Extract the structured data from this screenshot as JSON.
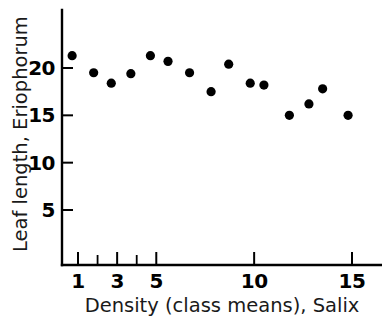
{
  "chart_data": {
    "type": "scatter",
    "title": "",
    "xlabel": "Density (class means), Salix",
    "ylabel": "Leaf length, Eriophorum",
    "xlim": [
      0.0,
      16.0
    ],
    "ylim": [
      0.0,
      23.5
    ],
    "grid": false,
    "legend": null,
    "x_ticks": [
      1,
      2,
      3,
      4,
      5,
      10,
      15
    ],
    "x_tick_labels": [
      "1",
      "",
      "3",
      "",
      "5",
      "10",
      "15"
    ],
    "y_ticks": [
      5,
      10,
      15,
      20
    ],
    "y_tick_labels": [
      "5",
      "10",
      "15",
      "20"
    ],
    "marker": "filled-circle",
    "marker_color": "#000000",
    "points": [
      {
        "x": 0.7,
        "y": 21.3
      },
      {
        "x": 1.8,
        "y": 19.5
      },
      {
        "x": 2.7,
        "y": 18.4
      },
      {
        "x": 3.7,
        "y": 19.4
      },
      {
        "x": 4.7,
        "y": 21.3
      },
      {
        "x": 5.6,
        "y": 20.7
      },
      {
        "x": 6.7,
        "y": 19.5
      },
      {
        "x": 7.8,
        "y": 17.5
      },
      {
        "x": 8.7,
        "y": 20.4
      },
      {
        "x": 9.8,
        "y": 18.4
      },
      {
        "x": 10.5,
        "y": 18.2
      },
      {
        "x": 11.8,
        "y": 15.0
      },
      {
        "x": 12.8,
        "y": 16.2
      },
      {
        "x": 13.5,
        "y": 17.8
      },
      {
        "x": 14.8,
        "y": 15.0
      }
    ]
  }
}
